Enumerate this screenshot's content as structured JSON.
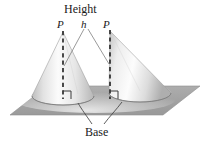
{
  "figure": {
    "kind": "geometry-illustration",
    "background_color": "#ffffff",
    "labels": {
      "height": "Height",
      "base": "Base",
      "apex_left": "P",
      "apex_right": "P",
      "height_symbol": "h"
    },
    "colors": {
      "plane_fill": "#a5a5a5",
      "plane_edge": "#8f8f8f",
      "cone_light": "#fdfdfd",
      "cone_mid": "#d8d8d8",
      "cone_dark": "#a8a8a8",
      "dashed_line": "#2b2b2b",
      "leader_line": "#6e6e6e",
      "text": "#1a1a1a"
    },
    "elements": {
      "plane": {
        "name": "base-plane",
        "shape": "parallelogram",
        "points": "10,115 47,86 200,86 163,115"
      },
      "left_cone": {
        "name": "right-cone-left",
        "type": "right circular cone",
        "apex": [
          63,
          32
        ],
        "base_center": [
          63,
          96
        ],
        "base_rx": 31,
        "base_ry": 9,
        "oblique": false
      },
      "right_cone": {
        "name": "oblique-cone-right",
        "type": "oblique circular cone",
        "apex": [
          110,
          31
        ],
        "base_center": [
          140,
          93
        ],
        "base_rx": 31,
        "base_ry": 9,
        "oblique": true
      },
      "altitude_left": {
        "name": "altitude-dashed-left",
        "from": [
          63,
          32
        ],
        "to": [
          63,
          98
        ],
        "right_angle_marker": true
      },
      "altitude_right": {
        "name": "altitude-dashed-right",
        "from": [
          110,
          31
        ],
        "to": [
          110,
          98
        ],
        "right_angle_marker": true
      },
      "leader_h_left": {
        "name": "leader-h-to-left-altitude",
        "from": [
          84,
          28
        ],
        "to": [
          64,
          65
        ]
      },
      "leader_h_right": {
        "name": "leader-h-to-right-altitude",
        "from": [
          88,
          28
        ],
        "to": [
          109,
          63
        ]
      },
      "leader_base_left": {
        "name": "leader-base-to-left-ellipse",
        "path": "M 92,124 C 86,116 82,110 78,104"
      },
      "leader_base_right": {
        "name": "leader-base-to-right-ellipse",
        "path": "M 104,124 C 110,116 116,110 122,103"
      }
    }
  }
}
